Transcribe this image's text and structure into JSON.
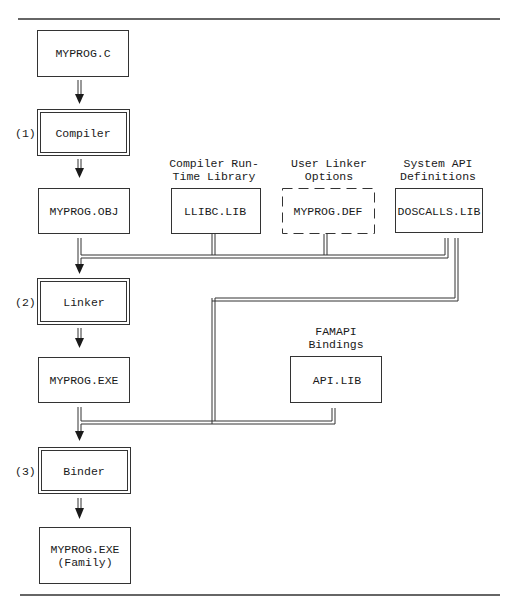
{
  "diagram": {
    "nodes": {
      "source": {
        "label": "MYPROG.C"
      },
      "compiler": {
        "label": "Compiler",
        "step": "(1)"
      },
      "object": {
        "label": "MYPROG.OBJ"
      },
      "runtime_lib": {
        "caption_line1": "Compiler Run-",
        "caption_line2": "Time Library",
        "label": "LLIBC.LIB"
      },
      "linker_options": {
        "caption_line1": "User Linker",
        "caption_line2": "Options",
        "label": "MYPROG.DEF"
      },
      "system_api": {
        "caption_line1": "System API",
        "caption_line2": "Definitions",
        "label": "DOSCALLS.LIB"
      },
      "linker": {
        "label": "Linker",
        "step": "(2)"
      },
      "executable": {
        "label": "MYPROG.EXE"
      },
      "famapi": {
        "caption_line1": "FAMAPI",
        "caption_line2": "Bindings",
        "label": "API.LIB"
      },
      "binder": {
        "label": "Binder",
        "step": "(3)"
      },
      "family_exe": {
        "label_line1": "MYPROG.EXE",
        "label_line2": "(Family)"
      }
    }
  }
}
